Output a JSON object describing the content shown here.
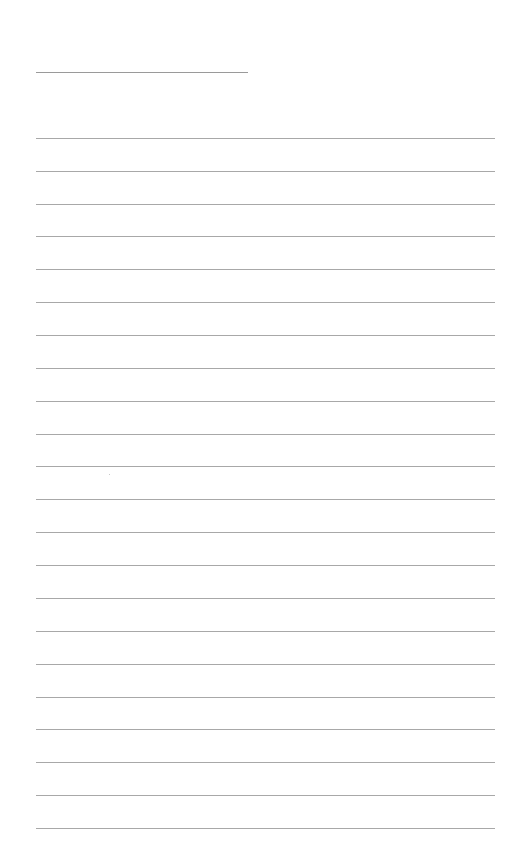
{
  "document": {
    "type": "lined-paper",
    "background": "#ffffff",
    "line_color": "#a8a8a8",
    "header_line": {
      "x": 36,
      "y": 72,
      "width": 212
    },
    "rules": {
      "x": 36,
      "width": 459,
      "count": 22,
      "y_positions": [
        138,
        171,
        204,
        236,
        269,
        302,
        335,
        368,
        401,
        434,
        466,
        499,
        532,
        565,
        598,
        631,
        664,
        697,
        729,
        762,
        795,
        828
      ]
    }
  }
}
